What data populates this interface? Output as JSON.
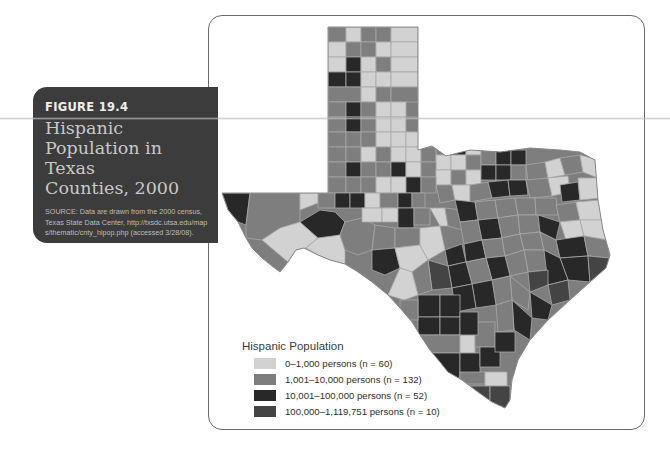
{
  "figure": {
    "number": "FIGURE 19.4",
    "title_lines": [
      "Hispanic",
      "Population in Texas",
      "Counties, 2000"
    ],
    "source": "SOURCE: Data are drawn from the 2000 census, Texas State Data Center, http://txsdc.utsa.edu/maps/thematic/cnty_hipop.php (accessed 3/28/08)."
  },
  "map": {
    "region": "Texas counties",
    "legend": {
      "title": "Hispanic Population",
      "items": [
        {
          "label": "0–1,000 persons (n = 60)",
          "color": "#d2d2d2"
        },
        {
          "label": "1,001–10,000 persons (n = 132)",
          "color": "#7e7e7e"
        },
        {
          "label": "10,001–100,000 persons (n = 52)",
          "color": "#282828"
        },
        {
          "label": "100,000–1,119,751 persons (n = 10)",
          "color": "#444444"
        }
      ]
    }
  },
  "colors": {
    "label_box": "#3c3c3c",
    "frame_border": "#6a6a6a",
    "county_border": "#a8a8a8"
  }
}
